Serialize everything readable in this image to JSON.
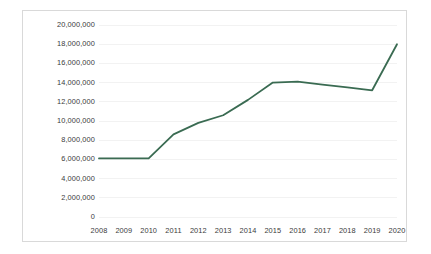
{
  "chart_data": {
    "type": "line",
    "title": "",
    "xlabel": "",
    "ylabel": "",
    "categories": [
      "2008",
      "2009",
      "2010",
      "2011",
      "2012",
      "2013",
      "2014",
      "2015",
      "2016",
      "2017",
      "2018",
      "2019",
      "2020"
    ],
    "series": [
      {
        "name": "Series 1",
        "color": "#3a6b52",
        "values": [
          6100000,
          6100000,
          6100000,
          8600000,
          9800000,
          10600000,
          12200000,
          14000000,
          14100000,
          13800000,
          13500000,
          13200000,
          18000000
        ]
      }
    ],
    "ylim": [
      0,
      20000000
    ],
    "y_tick_values": [
      20000000,
      18000000,
      16000000,
      14000000,
      12000000,
      10000000,
      8000000,
      6000000,
      4000000,
      2000000,
      0
    ],
    "y_tick_labels": [
      "20,000,000",
      "18,000,000",
      "16,000,000",
      "14,000,000",
      "12,000,000",
      "10,000,000",
      "8,000,000",
      "6,000,000",
      "4,000,000",
      "2,000,000",
      "0"
    ],
    "x_tick_labels": [
      "2008",
      "2009",
      "2010",
      "2011",
      "2012",
      "2013",
      "2014",
      "2015",
      "2016",
      "2017",
      "2018",
      "2019",
      "2020"
    ],
    "grid": true,
    "grid_axis": "y",
    "legend": false,
    "legend_position": "none",
    "plot_border_color": "#d9d9d9",
    "gridline_color": "#f2f2f2",
    "background_color": "#ffffff",
    "tick_label_color": "#3b3b3b"
  }
}
